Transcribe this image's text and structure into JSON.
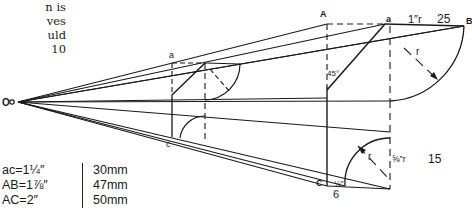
{
  "body_text": [
    "n is",
    "ves",
    "uld",
    "10"
  ],
  "labels": {
    "O": "O",
    "A": "A",
    "B": "B",
    "a_top_right": "a",
    "a_left": "a",
    "c_left": "c",
    "C_bottom": "C",
    "angle": "45°",
    "r_top": "r",
    "r_bottom": "r",
    "top_radius": "1″r",
    "top_radius_mm": "25",
    "bottom_radius": "⅝″r",
    "bottom_radius_mm": "15",
    "quarter_inch": "¼″",
    "quarter_inch_mm": "6"
  },
  "conversions": [
    {
      "imperial": "ac=1¼″",
      "metric": "30mm"
    },
    {
      "imperial": "AB=1⅞″",
      "metric": "47mm"
    },
    {
      "imperial": "AC=2″",
      "metric": "50mm"
    }
  ]
}
